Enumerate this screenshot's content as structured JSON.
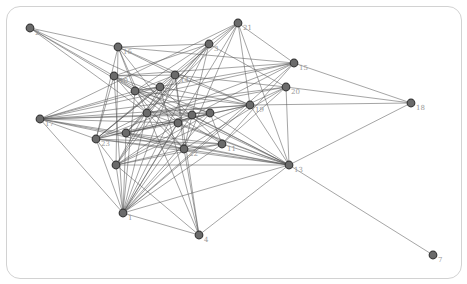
{
  "graph": {
    "type": "network",
    "node_color": "#6b6b6b",
    "edge_color": "#555555",
    "nodes": [
      {
        "id": "n2",
        "label": "2",
        "x": 30,
        "y": 28
      },
      {
        "id": "n16",
        "label": "16",
        "x": 118,
        "y": 47
      },
      {
        "id": "n3",
        "label": "3",
        "x": 209,
        "y": 44
      },
      {
        "id": "n21",
        "label": "21",
        "x": 238,
        "y": 23
      },
      {
        "id": "n15",
        "label": "15",
        "x": 294,
        "y": 63
      },
      {
        "id": "n20",
        "label": "20",
        "x": 286,
        "y": 87
      },
      {
        "id": "n10",
        "label": "10",
        "x": 114,
        "y": 76
      },
      {
        "id": "n14",
        "label": "14",
        "x": 175,
        "y": 75
      },
      {
        "id": "a",
        "label": "",
        "x": 135,
        "y": 91
      },
      {
        "id": "b",
        "label": "",
        "x": 160,
        "y": 87
      },
      {
        "id": "n19",
        "label": "19",
        "x": 250,
        "y": 105
      },
      {
        "id": "n18",
        "label": "18",
        "x": 411,
        "y": 103
      },
      {
        "id": "c",
        "label": "",
        "x": 147,
        "y": 113
      },
      {
        "id": "d",
        "label": "",
        "x": 178,
        "y": 123
      },
      {
        "id": "e",
        "label": "",
        "x": 210,
        "y": 113
      },
      {
        "id": "f",
        "label": "",
        "x": 192,
        "y": 115
      },
      {
        "id": "n17",
        "label": "17",
        "x": 40,
        "y": 119
      },
      {
        "id": "n23",
        "label": "23",
        "x": 96,
        "y": 139
      },
      {
        "id": "g",
        "label": "",
        "x": 126,
        "y": 133
      },
      {
        "id": "n22",
        "label": "22",
        "x": 184,
        "y": 149
      },
      {
        "id": "n11",
        "label": "11",
        "x": 222,
        "y": 144
      },
      {
        "id": "n13",
        "label": "13",
        "x": 289,
        "y": 165
      },
      {
        "id": "h",
        "label": "",
        "x": 116,
        "y": 165
      },
      {
        "id": "n1",
        "label": "1",
        "x": 123,
        "y": 213
      },
      {
        "id": "n4",
        "label": "4",
        "x": 199,
        "y": 235
      },
      {
        "id": "n7",
        "label": "7",
        "x": 433,
        "y": 255
      }
    ],
    "edges": [
      [
        "n2",
        "n16"
      ],
      [
        "n2",
        "n10"
      ],
      [
        "n2",
        "a"
      ],
      [
        "n2",
        "c"
      ],
      [
        "n2",
        "b"
      ],
      [
        "n16",
        "n3"
      ],
      [
        "n16",
        "n15"
      ],
      [
        "n16",
        "n14"
      ],
      [
        "n16",
        "a"
      ],
      [
        "n16",
        "c"
      ],
      [
        "n16",
        "n23"
      ],
      [
        "n16",
        "d"
      ],
      [
        "n16",
        "n19"
      ],
      [
        "n16",
        "h"
      ],
      [
        "n3",
        "n10"
      ],
      [
        "n3",
        "c"
      ],
      [
        "n3",
        "n23"
      ],
      [
        "n3",
        "g"
      ],
      [
        "n3",
        "n22"
      ],
      [
        "n3",
        "n1"
      ],
      [
        "n3",
        "n20"
      ],
      [
        "n3",
        "h"
      ],
      [
        "n21",
        "n14"
      ],
      [
        "n21",
        "a"
      ],
      [
        "n21",
        "n17"
      ],
      [
        "n21",
        "n19"
      ],
      [
        "n21",
        "n15"
      ],
      [
        "n21",
        "n22"
      ],
      [
        "n21",
        "n1"
      ],
      [
        "n21",
        "n13"
      ],
      [
        "n21",
        "g"
      ],
      [
        "n15",
        "n10"
      ],
      [
        "n15",
        "n18"
      ],
      [
        "n15",
        "a"
      ],
      [
        "n15",
        "n23"
      ],
      [
        "n15",
        "n11"
      ],
      [
        "n15",
        "n17"
      ],
      [
        "n15",
        "n1"
      ],
      [
        "n15",
        "d"
      ],
      [
        "n20",
        "n18"
      ],
      [
        "n20",
        "n14"
      ],
      [
        "n20",
        "c"
      ],
      [
        "n20",
        "n17"
      ],
      [
        "n20",
        "n13"
      ],
      [
        "n20",
        "n11"
      ],
      [
        "n20",
        "h"
      ],
      [
        "n20",
        "n22"
      ],
      [
        "n10",
        "n14"
      ],
      [
        "n10",
        "c"
      ],
      [
        "n10",
        "d"
      ],
      [
        "n10",
        "n11"
      ],
      [
        "n10",
        "n23"
      ],
      [
        "n10",
        "n1"
      ],
      [
        "n10",
        "n13"
      ],
      [
        "n10",
        "e"
      ],
      [
        "n14",
        "a"
      ],
      [
        "n14",
        "n23"
      ],
      [
        "n14",
        "g"
      ],
      [
        "n14",
        "n1"
      ],
      [
        "n14",
        "n19"
      ],
      [
        "n14",
        "n22"
      ],
      [
        "n14",
        "h"
      ],
      [
        "n14",
        "n4"
      ],
      [
        "a",
        "b"
      ],
      [
        "a",
        "n19"
      ],
      [
        "a",
        "e"
      ],
      [
        "a",
        "n22"
      ],
      [
        "a",
        "n13"
      ],
      [
        "a",
        "n1"
      ],
      [
        "a",
        "n17"
      ],
      [
        "b",
        "n19"
      ],
      [
        "b",
        "n17"
      ],
      [
        "b",
        "n11"
      ],
      [
        "b",
        "h"
      ],
      [
        "b",
        "n23"
      ],
      [
        "b",
        "n4"
      ],
      [
        "n19",
        "n17"
      ],
      [
        "n19",
        "n23"
      ],
      [
        "n19",
        "n13"
      ],
      [
        "n19",
        "g"
      ],
      [
        "n19",
        "n1"
      ],
      [
        "n19",
        "c"
      ],
      [
        "n18",
        "n13"
      ],
      [
        "n18",
        "n19"
      ],
      [
        "c",
        "e"
      ],
      [
        "c",
        "n22"
      ],
      [
        "c",
        "n13"
      ],
      [
        "c",
        "n1"
      ],
      [
        "c",
        "n23"
      ],
      [
        "c",
        "n4"
      ],
      [
        "d",
        "e"
      ],
      [
        "d",
        "n17"
      ],
      [
        "d",
        "n13"
      ],
      [
        "d",
        "n1"
      ],
      [
        "d",
        "g"
      ],
      [
        "d",
        "h"
      ],
      [
        "e",
        "n17"
      ],
      [
        "e",
        "g"
      ],
      [
        "e",
        "n11"
      ],
      [
        "e",
        "h"
      ],
      [
        "e",
        "n1"
      ],
      [
        "e",
        "n13"
      ],
      [
        "f",
        "n23"
      ],
      [
        "f",
        "n1"
      ],
      [
        "f",
        "n13"
      ],
      [
        "f",
        "n17"
      ],
      [
        "n17",
        "n23"
      ],
      [
        "n17",
        "n22"
      ],
      [
        "n17",
        "n1"
      ],
      [
        "n17",
        "n13"
      ],
      [
        "n17",
        "g"
      ],
      [
        "n23",
        "n22"
      ],
      [
        "n23",
        "n11"
      ],
      [
        "n23",
        "n1"
      ],
      [
        "n23",
        "h"
      ],
      [
        "n23",
        "n13"
      ],
      [
        "g",
        "n22"
      ],
      [
        "g",
        "n11"
      ],
      [
        "g",
        "n1"
      ],
      [
        "g",
        "n13"
      ],
      [
        "n22",
        "n11"
      ],
      [
        "n22",
        "n13"
      ],
      [
        "n22",
        "h"
      ],
      [
        "n22",
        "n1"
      ],
      [
        "n22",
        "n4"
      ],
      [
        "n11",
        "n13"
      ],
      [
        "n11",
        "n1"
      ],
      [
        "n11",
        "h"
      ],
      [
        "n13",
        "n7"
      ],
      [
        "n13",
        "n1"
      ],
      [
        "n13",
        "h"
      ],
      [
        "n13",
        "n4"
      ],
      [
        "h",
        "n1"
      ],
      [
        "h",
        "n4"
      ],
      [
        "n1",
        "n4"
      ]
    ]
  }
}
